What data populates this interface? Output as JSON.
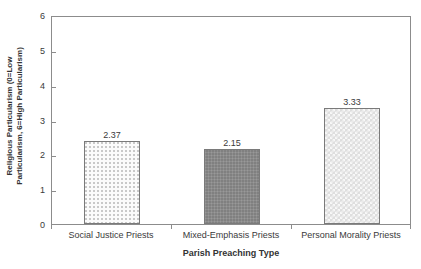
{
  "chart_data": {
    "type": "bar",
    "title": "",
    "xlabel": "Parish Preaching Type",
    "ylabel_line1": "Religious Particularism (0=Low",
    "ylabel_line2": "Particularism, 6=High Particularism)",
    "ylabel_full": "Religious Particularism (0=Low Particularism, 6=High Particularism)",
    "categories": [
      "Social Justice Priests",
      "Mixed-Emphasis Priests",
      "Personal Morality Priests"
    ],
    "values": [
      2.37,
      2.15,
      3.33
    ],
    "value_labels": [
      "2.37",
      "2.15",
      "3.33"
    ],
    "ylim": [
      0,
      6
    ],
    "yticks": [
      0,
      1,
      2,
      3,
      4,
      5,
      6
    ],
    "ytick_labels": [
      "0",
      "1",
      "2",
      "3",
      "4",
      "5",
      "6"
    ],
    "grid": false,
    "legend": null,
    "bar_styles": [
      "dotted-light",
      "solid-dark-gray",
      "checkered-light-gray"
    ],
    "bar_colors": [
      "#fbfbfb",
      "#808080",
      "#dedede"
    ],
    "bar_edge_color": "#7a7a7a",
    "frame_color": "#8c8c8c",
    "background": "#ffffff"
  }
}
